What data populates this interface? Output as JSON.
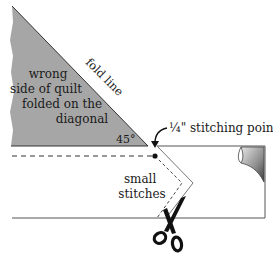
{
  "diagram": {
    "triangle_label": [
      "wrong",
      "side of quilt",
      "folded on the",
      "diagonal"
    ],
    "fold_line_label": "fold line",
    "angle_label": "45°",
    "stitch_point_label": "¼\" stitching point",
    "small_stitches_label": [
      "small",
      "stitches"
    ],
    "colors": {
      "triangle_fill": "#a6a6a6",
      "line": "#333333",
      "background": "#ffffff"
    }
  }
}
